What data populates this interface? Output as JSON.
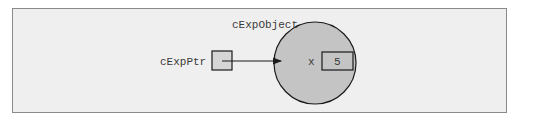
{
  "diagram": {
    "object_label": "cExpObject",
    "pointer_label": "cExpPtr",
    "member_name": "x",
    "member_value": "5",
    "colors": {
      "background": "#efefef",
      "frame_border": "#8a8a8a",
      "circle_fill": "#c4c4c4",
      "box_fill_pointer": "#d6d6d6",
      "box_fill_member": "#c4c4c4",
      "stroke": "#1a1a1a",
      "text": "#3a3a3a"
    }
  }
}
